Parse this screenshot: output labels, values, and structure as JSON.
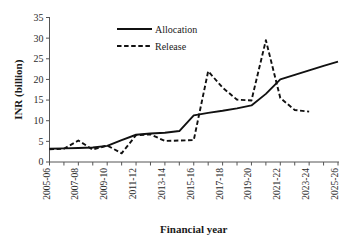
{
  "chart_data": {
    "type": "line",
    "title": "",
    "xlabel": "Financial year",
    "ylabel": "INR (billion)",
    "ylim": [
      0,
      35
    ],
    "yticks": [
      0,
      5,
      10,
      15,
      20,
      25,
      30,
      35
    ],
    "grid": false,
    "legend_position": "top-center",
    "x": [
      "2005-06",
      "2006-07",
      "2007-08",
      "2008-09",
      "2009-10",
      "2010-11",
      "2011-12",
      "2012-13",
      "2013-14",
      "2014-15",
      "2015-16",
      "2016-17",
      "2017-18",
      "2018-19",
      "2019-20",
      "2020-21",
      "2021-22",
      "2022-23",
      "2023-24",
      "2024-25",
      "2025-26"
    ],
    "xtick_labels": [
      "2005-06",
      "2007-08",
      "2009-10",
      "2011-12",
      "2013-14",
      "2015-16",
      "2017-18",
      "2019-20",
      "2021-22",
      "2023-24",
      "2025-26"
    ],
    "series": [
      {
        "name": "Allocation",
        "style": "solid",
        "color": "#111111",
        "values": [
          3.2,
          3.3,
          3.4,
          3.5,
          3.9,
          5.3,
          6.6,
          6.9,
          7.1,
          7.5,
          11.3,
          11.9,
          12.4,
          13.0,
          13.7,
          16.5,
          20.0,
          21.1,
          22.2,
          23.3,
          24.3
        ]
      },
      {
        "name": "Release",
        "style": "dashed",
        "color": "#111111",
        "values": [
          3.1,
          3.2,
          5.2,
          3.0,
          4.0,
          2.1,
          6.5,
          6.7,
          5.1,
          5.2,
          5.3,
          22.0,
          18.0,
          15.1,
          14.9,
          29.5,
          15.5,
          12.6,
          12.2,
          null,
          null
        ]
      }
    ],
    "legend": [
      {
        "label": "Allocation",
        "style": "solid"
      },
      {
        "label": "Release",
        "style": "dashed"
      }
    ]
  }
}
